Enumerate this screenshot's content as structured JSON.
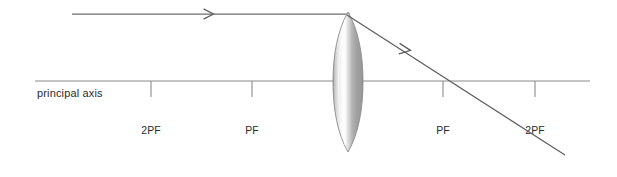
{
  "diagram": {
    "canvas": {
      "width": 617,
      "height": 177,
      "background": "#ffffff"
    },
    "principal_axis": {
      "label": "principal axis",
      "label_x": 37,
      "label_y": 97,
      "y": 81,
      "x_start": 35,
      "x_end": 590,
      "color": "#8a8a8a",
      "stroke_width": 1.1
    },
    "lens": {
      "name": "convex converging lens",
      "center_x": 348,
      "top_y": 12,
      "bottom_y": 152,
      "half_width": 15,
      "outline_color": "#8c8c8c",
      "gradient": {
        "edge_dark": "#8e8e8e",
        "mid_light": "#ffffff",
        "body_gray": "#b5b5b5",
        "right_dark": "#9a9a9a"
      }
    },
    "rays": [
      {
        "name": "incident-ray",
        "description": "parallel incident ray travelling left to right toward the lens",
        "x_start": 72,
        "y_start": 14,
        "x_end": 348,
        "y_end": 14,
        "color": "#6e6e6e",
        "stroke_width": 1.2,
        "arrow": {
          "x": 212,
          "y": 14,
          "angle_deg": 0
        }
      },
      {
        "name": "refracted-ray",
        "description": "refracted ray converging through the focal point on the right",
        "x_start": 349,
        "y_start": 16,
        "x_end": 565,
        "y_end": 155,
        "color": "#5f5f5f",
        "stroke_width": 1.2,
        "arrow": {
          "x": 408,
          "y": 53,
          "angle_deg": 32.8
        }
      }
    ],
    "tick_marks": [
      {
        "name": "tick-2pf-left",
        "label": "2PF",
        "x": 151,
        "y_top": 81,
        "y_bottom": 97,
        "label_y": 134
      },
      {
        "name": "tick-pf-left",
        "label": "PF",
        "x": 252,
        "y_top": 81,
        "y_bottom": 97,
        "label_y": 134
      },
      {
        "name": "tick-pf-right",
        "label": "PF",
        "x": 443,
        "y_top": 81,
        "y_bottom": 97,
        "label_y": 134
      },
      {
        "name": "tick-2pf-right",
        "label": "2PF",
        "x": 535,
        "y_top": 81,
        "y_bottom": 97,
        "label_y": 134
      }
    ],
    "colors": {
      "ray": "#6e6e6e",
      "axis": "#8a8a8a",
      "text": "#2b2b2b",
      "tick": "#8a8a8a"
    }
  }
}
